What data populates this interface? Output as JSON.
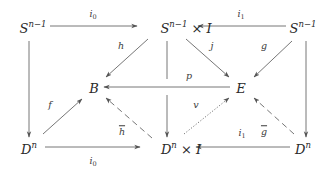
{
  "diagram": {
    "type": "commutative-diagram",
    "nodes": {
      "top_left": {
        "base": "S",
        "sup": "n−1",
        "rest": ""
      },
      "top_center": {
        "base": "S",
        "sup": "n−1",
        "rest": " × I"
      },
      "top_right": {
        "base": "S",
        "sup": "n−1",
        "rest": ""
      },
      "mid_left": {
        "base": "B",
        "sup": "",
        "rest": ""
      },
      "mid_right": {
        "base": "E",
        "sup": "",
        "rest": ""
      },
      "bottom_left": {
        "base": "D",
        "sup": "n",
        "rest": ""
      },
      "bottom_center": {
        "base": "D",
        "sup": "n",
        "rest": " × I"
      },
      "bottom_right": {
        "base": "D",
        "sup": "n",
        "rest": ""
      }
    },
    "labels": {
      "i0_top": {
        "base": "i",
        "sub": "0"
      },
      "i1_top": {
        "base": "i",
        "sub": "1"
      },
      "i0_bottom": {
        "base": "i",
        "sub": "0"
      },
      "i1_bottom": {
        "base": "i",
        "sub": "1"
      },
      "h": "h",
      "j": "j",
      "g": "g",
      "p": "p",
      "f": "f",
      "v": "v",
      "h_bar": "h",
      "g_bar": "g"
    },
    "edges": [
      {
        "from": "top_left",
        "to": "top_center",
        "label": "i0",
        "style": "solid"
      },
      {
        "from": "top_right",
        "to": "top_center",
        "label": "i1",
        "style": "solid"
      },
      {
        "from": "top_center",
        "to": "mid_left",
        "label": "h",
        "style": "solid"
      },
      {
        "from": "top_center",
        "to": "mid_right",
        "label": "j",
        "style": "solid"
      },
      {
        "from": "top_right",
        "to": "mid_right",
        "label": "g",
        "style": "solid"
      },
      {
        "from": "mid_right",
        "to": "mid_left",
        "label": "p",
        "style": "solid"
      },
      {
        "from": "top_left",
        "to": "bottom_left",
        "label": "",
        "style": "solid"
      },
      {
        "from": "top_center",
        "to": "bottom_center",
        "label": "",
        "style": "solid"
      },
      {
        "from": "top_right",
        "to": "bottom_right",
        "label": "",
        "style": "solid"
      },
      {
        "from": "bottom_left",
        "to": "mid_left",
        "label": "f",
        "style": "solid"
      },
      {
        "from": "bottom_center",
        "to": "mid_left",
        "label": "h̄",
        "style": "dashed"
      },
      {
        "from": "bottom_center",
        "to": "mid_right",
        "label": "v",
        "style": "dotted"
      },
      {
        "from": "bottom_right",
        "to": "mid_right",
        "label": "ḡ",
        "style": "dashed"
      },
      {
        "from": "bottom_left",
        "to": "bottom_center",
        "label": "i0",
        "style": "solid"
      },
      {
        "from": "bottom_right",
        "to": "bottom_center",
        "label": "i1",
        "style": "solid"
      }
    ],
    "colors": {
      "line": "#555555",
      "text": "#2a2a2a",
      "background": "#ffffff"
    }
  }
}
